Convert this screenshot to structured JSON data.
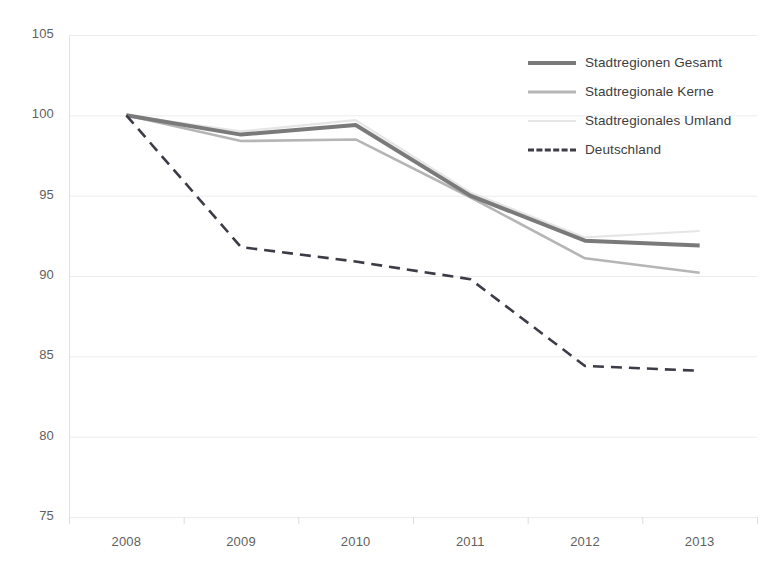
{
  "chart_data": {
    "type": "line",
    "title": "",
    "xlabel": "",
    "ylabel": "",
    "categories": [
      "2008",
      "2009",
      "2010",
      "2011",
      "2012",
      "2013"
    ],
    "x": [
      2008,
      2009,
      2010,
      2011,
      2012,
      2013
    ],
    "ylim": [
      75,
      105
    ],
    "yticks": [
      75,
      80,
      85,
      90,
      95,
      100,
      105
    ],
    "grid": true,
    "legend_position": "top-right",
    "series": [
      {
        "name": "Stadtregionen Gesamt",
        "values": [
          100.0,
          98.8,
          99.4,
          95.0,
          92.2,
          91.9
        ],
        "color": "#7a7a7a",
        "style": "solid",
        "width": 4
      },
      {
        "name": "Stadtregionale Kerne",
        "values": [
          100.0,
          98.4,
          98.5,
          94.9,
          91.1,
          90.2
        ],
        "color": "#b5b5b5",
        "style": "solid",
        "width": 2.6
      },
      {
        "name": "Stadtregionales Umland",
        "values": [
          100.0,
          99.0,
          99.7,
          95.2,
          92.4,
          92.8
        ],
        "color": "#e6e6e6",
        "style": "solid",
        "width": 2.2
      },
      {
        "name": "Deutschland",
        "values": [
          100.0,
          91.8,
          90.9,
          89.8,
          84.4,
          84.1
        ],
        "color": "#3c3c46",
        "style": "dashed",
        "width": 2.6
      }
    ]
  },
  "axis": {
    "y_labels": [
      "105",
      "100",
      "95",
      "90",
      "85",
      "80",
      "75"
    ],
    "x_labels": [
      "2008",
      "2009",
      "2010",
      "2011",
      "2012",
      "2013"
    ]
  },
  "legend": {
    "items": [
      {
        "label": "Stadtregionen Gesamt"
      },
      {
        "label": "Stadtregionale Kerne"
      },
      {
        "label": "Stadtregionales Umland"
      },
      {
        "label": "Deutschland"
      }
    ]
  },
  "colors": {
    "grid": "#ececec",
    "axis_text": "#5f5f5f",
    "legend_text": "#3d3d3d",
    "background": "#ffffff"
  }
}
